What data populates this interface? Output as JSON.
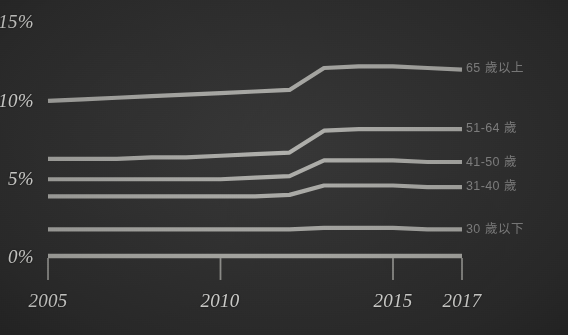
{
  "chart_data": {
    "type": "line",
    "title": "",
    "subtitle": "",
    "xlabel": "",
    "ylabel": "",
    "grid": false,
    "legend_position": "right-inline",
    "x": [
      2005,
      2006,
      2007,
      2008,
      2009,
      2010,
      2011,
      2012,
      2013,
      2014,
      2015,
      2016,
      2017
    ],
    "xlim": [
      2005,
      2017
    ],
    "ylim": [
      0,
      15
    ],
    "xticks": [
      2005,
      2010,
      2015,
      2017
    ],
    "xtick_labels": [
      "2005",
      "2010",
      "2015",
      "2017"
    ],
    "yticks": [
      0,
      5,
      10,
      15
    ],
    "ytick_labels": [
      "0%",
      "5%",
      "10%",
      "15%"
    ],
    "series": [
      {
        "name": "65 歲以上",
        "label": "65 歲以上",
        "values": [
          9.9,
          10.0,
          10.1,
          10.2,
          10.3,
          10.4,
          10.5,
          10.6,
          12.0,
          12.1,
          12.1,
          12.0,
          11.9
        ]
      },
      {
        "name": "51-64 歲",
        "label": "51-64 歲",
        "values": [
          6.2,
          6.2,
          6.2,
          6.3,
          6.3,
          6.4,
          6.5,
          6.6,
          8.0,
          8.1,
          8.1,
          8.1,
          8.1
        ]
      },
      {
        "name": "41-50 歲",
        "label": "41-50 歲",
        "values": [
          4.9,
          4.9,
          4.9,
          4.9,
          4.9,
          4.9,
          5.0,
          5.1,
          6.1,
          6.1,
          6.1,
          6.0,
          6.0
        ]
      },
      {
        "name": "31-40 歲",
        "label": "31-40 歲",
        "values": [
          3.8,
          3.8,
          3.8,
          3.8,
          3.8,
          3.8,
          3.8,
          3.9,
          4.5,
          4.5,
          4.5,
          4.4,
          4.4
        ]
      },
      {
        "name": "30 歲以下",
        "label": "30 歲以下",
        "values": [
          1.7,
          1.7,
          1.7,
          1.7,
          1.7,
          1.7,
          1.7,
          1.7,
          1.8,
          1.8,
          1.8,
          1.7,
          1.7
        ]
      }
    ],
    "colors": {
      "line": "#b9b9b4",
      "axis": "#b9b9b4",
      "background": "#313131",
      "axis_text": "#e9e9e6",
      "legend_text": "#8c8c8c"
    }
  },
  "axes": {
    "y": {
      "t15": "15%",
      "t10": "10%",
      "t5": "5%",
      "t0": "0%"
    },
    "x": {
      "t2005": "2005",
      "t2010": "2010",
      "t2015": "2015",
      "t2017": "2017"
    }
  },
  "legend": {
    "s65": "65 歲以上",
    "s5164": "51-64 歲",
    "s4150": "41-50 歲",
    "s3140": "31-40 歲",
    "s30": "30 歲以下"
  }
}
